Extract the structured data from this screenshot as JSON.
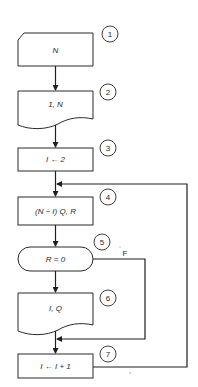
{
  "diagram": {
    "type": "flowchart",
    "steps": [
      {
        "id": 1,
        "shape": "card-input",
        "label": "N",
        "number": "1"
      },
      {
        "id": 2,
        "shape": "document-output",
        "label": "1, N",
        "number": "2"
      },
      {
        "id": 3,
        "shape": "process",
        "label": "I ← 2",
        "number": "3"
      },
      {
        "id": 4,
        "shape": "process",
        "label": "(N ÷ I) Q, R",
        "number": "4"
      },
      {
        "id": 5,
        "shape": "decision-terminal",
        "label": "R = 0",
        "number": "5",
        "false_branch_label": "F"
      },
      {
        "id": 6,
        "shape": "document-output",
        "label": "I, Q",
        "number": "6"
      },
      {
        "id": 7,
        "shape": "process",
        "label": "I ← I + 1",
        "number": "7"
      }
    ],
    "colors": {
      "stroke": "#2a2a2a",
      "background": "#ffffff"
    }
  }
}
